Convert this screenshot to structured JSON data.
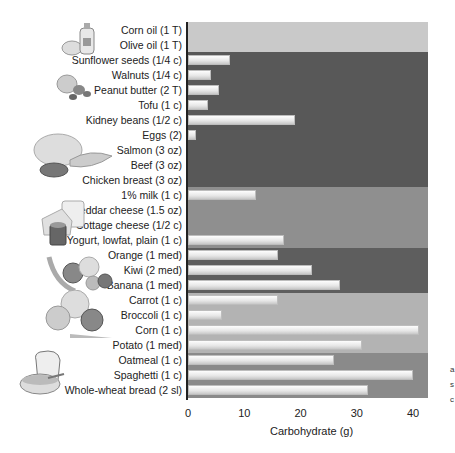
{
  "chart_data": {
    "type": "bar",
    "orientation": "horizontal",
    "title": "",
    "xlabel": "Carbohydrate (g)",
    "ylabel": "",
    "xlim": [
      0,
      43
    ],
    "xticks": [
      0,
      10,
      20,
      30,
      40
    ],
    "grid": false,
    "legend": null,
    "categories": [
      "Corn oil (1 T)",
      "Olive oil (1 T)",
      "Sunflower seeds (1/4 c)",
      "Walnuts (1/4 c)",
      "Peanut butter (2 T)",
      "Tofu (1 c)",
      "Kidney beans (1/2 c)",
      "Eggs (2)",
      "Salmon (3 oz)",
      "Beef (3 oz)",
      "Chicken breast (3 oz)",
      "1% milk (1 c)",
      "Cheddar cheese (1.5 oz)",
      "Cottage cheese (1/2 c)",
      "Yogurt, lowfat, plain (1 c)",
      "Orange (1 med)",
      "Kiwi (2 med)",
      "Banana (1 med)",
      "Carrot (1 c)",
      "Broccoli (1 c)",
      "Corn (1 c)",
      "Potato (1 med)",
      "Oatmeal (1 c)",
      "Spaghetti (1 c)",
      "Whole-wheat bread (2 sl)"
    ],
    "values": [
      0,
      0,
      7.5,
      4,
      5.5,
      3.5,
      19,
      1.5,
      0,
      0,
      0,
      12,
      0,
      0,
      17,
      16,
      22,
      27,
      16,
      6,
      41,
      31,
      26,
      40,
      32
    ],
    "groups": [
      {
        "name": "oils",
        "rows": [
          0,
          1
        ],
        "color": "#c9c9c9"
      },
      {
        "name": "protein",
        "rows": [
          2,
          10
        ],
        "color": "#585858"
      },
      {
        "name": "dairy",
        "rows": [
          11,
          14
        ],
        "color": "#8f8f8f"
      },
      {
        "name": "fruit",
        "rows": [
          15,
          17
        ],
        "color": "#5e5e5e"
      },
      {
        "name": "vegetables",
        "rows": [
          18,
          21
        ],
        "color": "#b3b3b3"
      },
      {
        "name": "grains",
        "rows": [
          22,
          24
        ],
        "color": "#8a8a8a"
      }
    ]
  },
  "icons": [
    "oil-bottle-icon",
    "nuts-icon",
    "meat-fish-icon",
    "dairy-icon",
    "fruit-icon",
    "vegetables-icon",
    "bread-cereal-icon"
  ],
  "edge_text": [
    "a",
    "s",
    "c"
  ]
}
